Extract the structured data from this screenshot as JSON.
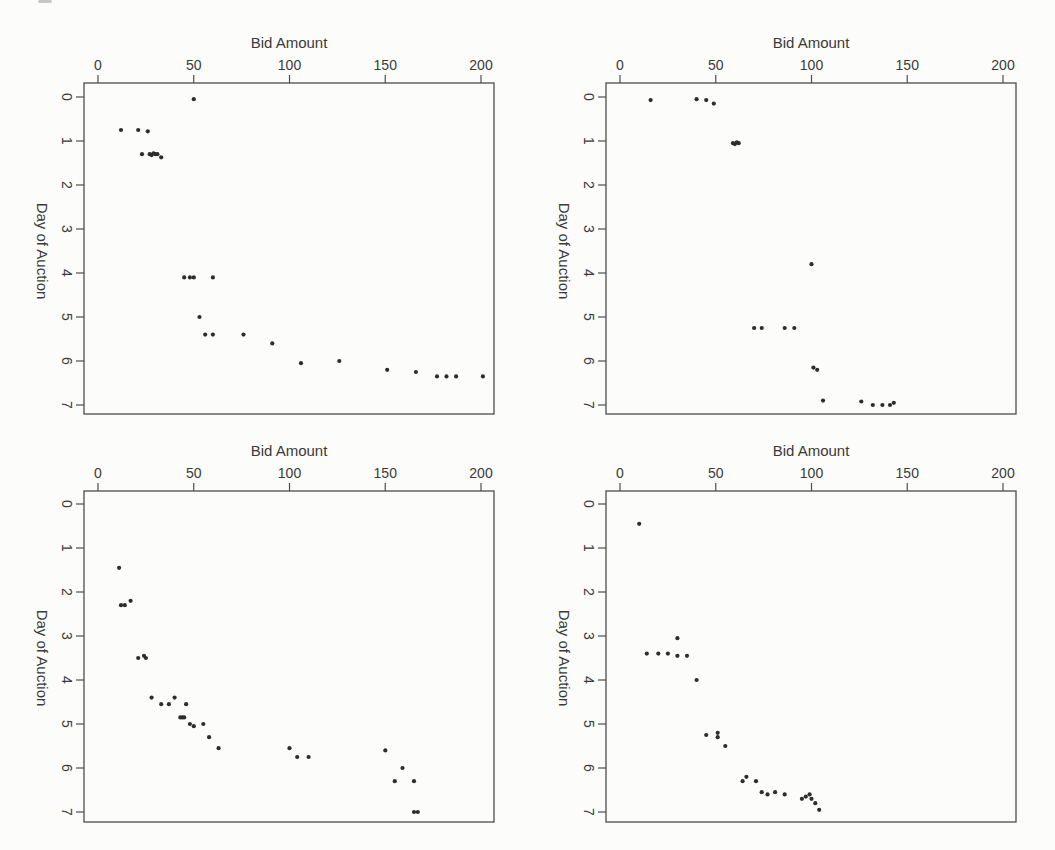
{
  "figure": {
    "xlabel": "Bid Amount",
    "ylabel": "Day of Auction",
    "x_ticks": [
      "0",
      "50",
      "100",
      "150",
      "200"
    ],
    "y_ticks": [
      "0",
      "1",
      "2",
      "3",
      "4",
      "5",
      "6",
      "7"
    ],
    "colors": {
      "background": "#fcfcfa",
      "frame": "#4d4d4d",
      "text": "#3a3a3a",
      "points": "#2d2d2d"
    }
  },
  "chart_data": [
    {
      "type": "scatter",
      "panel": "top-left",
      "title": "Bid Amount",
      "xlabel": "Bid Amount",
      "ylabel": "Day of Auction",
      "xlim": [
        0,
        207
      ],
      "ylim": [
        0,
        7.3
      ],
      "x_axis_position": "top",
      "y_axis_inverted": true,
      "grid": false,
      "points": [
        [
          50,
          0.05
        ],
        [
          12,
          0.75
        ],
        [
          21,
          0.75
        ],
        [
          26,
          0.78
        ],
        [
          23,
          1.3
        ],
        [
          27,
          1.3
        ],
        [
          28,
          1.32
        ],
        [
          29,
          1.28
        ],
        [
          30,
          1.3
        ],
        [
          31,
          1.3
        ],
        [
          33,
          1.37
        ],
        [
          45,
          4.1
        ],
        [
          48,
          4.1
        ],
        [
          50,
          4.1
        ],
        [
          60,
          4.1
        ],
        [
          53,
          5.0
        ],
        [
          56,
          5.4
        ],
        [
          60,
          5.4
        ],
        [
          76,
          5.4
        ],
        [
          91,
          5.6
        ],
        [
          106,
          6.05
        ],
        [
          126,
          6.0
        ],
        [
          151,
          6.2
        ],
        [
          166,
          6.25
        ],
        [
          177,
          6.35
        ],
        [
          182,
          6.35
        ],
        [
          187,
          6.35
        ],
        [
          201,
          6.35
        ]
      ]
    },
    {
      "type": "scatter",
      "panel": "top-right",
      "title": "Bid Amount",
      "xlabel": "Bid Amount",
      "ylabel": "Day of Auction",
      "xlim": [
        0,
        207
      ],
      "ylim": [
        0,
        7.3
      ],
      "x_axis_position": "top",
      "y_axis_inverted": true,
      "grid": false,
      "points": [
        [
          16,
          0.07
        ],
        [
          40,
          0.05
        ],
        [
          45,
          0.07
        ],
        [
          49,
          0.15
        ],
        [
          59,
          1.05
        ],
        [
          60,
          1.07
        ],
        [
          61,
          1.03
        ],
        [
          62,
          1.05
        ],
        [
          100,
          3.8
        ],
        [
          70,
          5.25
        ],
        [
          74,
          5.25
        ],
        [
          86,
          5.25
        ],
        [
          91,
          5.25
        ],
        [
          101,
          6.15
        ],
        [
          103,
          6.2
        ],
        [
          106,
          6.9
        ],
        [
          126,
          6.92
        ],
        [
          132,
          7.0
        ],
        [
          137,
          7.0
        ],
        [
          141,
          7.0
        ],
        [
          143,
          6.95
        ]
      ]
    },
    {
      "type": "scatter",
      "panel": "bottom-left",
      "title": "Bid Amount",
      "xlabel": "Bid Amount",
      "ylabel": "Day of Auction",
      "xlim": [
        0,
        207
      ],
      "ylim": [
        0,
        7.3
      ],
      "x_axis_position": "top",
      "y_axis_inverted": true,
      "grid": false,
      "points": [
        [
          11,
          1.45
        ],
        [
          17,
          2.2
        ],
        [
          12,
          2.3
        ],
        [
          14,
          2.3
        ],
        [
          21,
          3.5
        ],
        [
          24,
          3.45
        ],
        [
          25,
          3.5
        ],
        [
          28,
          4.4
        ],
        [
          33,
          4.55
        ],
        [
          37,
          4.55
        ],
        [
          40,
          4.4
        ],
        [
          46,
          4.55
        ],
        [
          43,
          4.85
        ],
        [
          44,
          4.85
        ],
        [
          45,
          4.85
        ],
        [
          48,
          5.0
        ],
        [
          50,
          5.05
        ],
        [
          55,
          5.0
        ],
        [
          58,
          5.3
        ],
        [
          63,
          5.55
        ],
        [
          100,
          5.55
        ],
        [
          104,
          5.75
        ],
        [
          110,
          5.75
        ],
        [
          150,
          5.6
        ],
        [
          159,
          6.0
        ],
        [
          155,
          6.3
        ],
        [
          165,
          6.3
        ],
        [
          165,
          7.0
        ],
        [
          167,
          7.0
        ]
      ]
    },
    {
      "type": "scatter",
      "panel": "bottom-right",
      "title": "Bid Amount",
      "xlabel": "Bid Amount",
      "ylabel": "Day of Auction",
      "xlim": [
        0,
        207
      ],
      "ylim": [
        0,
        7.3
      ],
      "x_axis_position": "top",
      "y_axis_inverted": true,
      "grid": false,
      "points": [
        [
          10,
          0.45
        ],
        [
          30,
          3.05
        ],
        [
          14,
          3.4
        ],
        [
          20,
          3.4
        ],
        [
          25,
          3.4
        ],
        [
          30,
          3.45
        ],
        [
          35,
          3.45
        ],
        [
          40,
          4.0
        ],
        [
          45,
          5.25
        ],
        [
          51,
          5.2
        ],
        [
          51,
          5.3
        ],
        [
          55,
          5.5
        ],
        [
          64,
          6.3
        ],
        [
          66,
          6.2
        ],
        [
          71,
          6.3
        ],
        [
          74,
          6.55
        ],
        [
          77,
          6.6
        ],
        [
          81,
          6.55
        ],
        [
          86,
          6.6
        ],
        [
          95,
          6.7
        ],
        [
          97,
          6.65
        ],
        [
          99,
          6.6
        ],
        [
          100,
          6.7
        ],
        [
          102,
          6.8
        ],
        [
          104,
          6.95
        ]
      ]
    }
  ]
}
